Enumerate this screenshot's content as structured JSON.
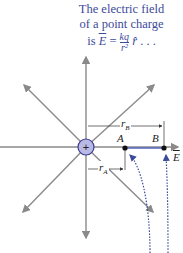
{
  "caption": {
    "line1": "The electric field",
    "line2": "of a point charge",
    "line3_prefix": "is ",
    "E": "E",
    "equals": " = ",
    "num": "kq",
    "den": "r²",
    "rhat": "r̂",
    "suffix": " . . ."
  },
  "diagram": {
    "charge_sign": "+",
    "point_a": "A",
    "point_b": "B",
    "r_a": "r",
    "r_a_sub": "A",
    "r_b": "r",
    "r_b_sub": "B",
    "field_label": "E",
    "colors": {
      "field_lines": "#8a8a8a",
      "charge_fill": "#b9b9e6",
      "charge_stroke": "#3c3c8c",
      "path": "#3c4a9a",
      "caption": "#3c4a9a"
    }
  }
}
